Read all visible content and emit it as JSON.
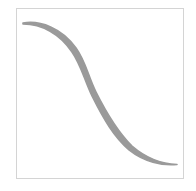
{
  "figure": {
    "frame": {
      "border_color": "#d4d4d4",
      "background": "#ffffff"
    },
    "curve": {
      "shape": "decreasing-s-curve",
      "stroke_color": "#9a9a9a",
      "start": [
        23,
        23
      ],
      "end": [
        177,
        164
      ]
    }
  }
}
